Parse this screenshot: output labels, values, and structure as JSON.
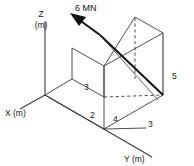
{
  "figure": {
    "background_color": "#ffffff",
    "line_color": "#3a3a3a",
    "bold_line_color": "#111111",
    "text_color": "#1a1a1a"
  },
  "axes": {
    "z": {
      "label": "Z",
      "unit": "(m)"
    },
    "x": {
      "label": "X (m)"
    },
    "y": {
      "label": "Y (m)"
    }
  },
  "force": {
    "magnitude": "6",
    "unit": "MN",
    "label": "6 MN"
  },
  "dimensions": [
    {
      "name": "height-left",
      "value": "3"
    },
    {
      "name": "offset-x",
      "value": "2"
    },
    {
      "name": "length-y",
      "value": "4"
    },
    {
      "name": "depth-x",
      "value": "3"
    },
    {
      "name": "height-right",
      "value": "5"
    }
  ]
}
